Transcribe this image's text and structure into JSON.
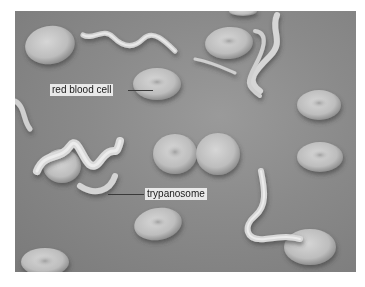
{
  "figure": {
    "type": "scanning electron micrograph",
    "labels": [
      {
        "id": "rbc",
        "text": "red blood cell"
      },
      {
        "id": "tryp",
        "text": "trypanosome"
      }
    ],
    "colors": {
      "background": "#888888",
      "cell_light": "#d8d8d8",
      "cell_mid": "#b5b5b5",
      "label_bg": "#e9e9e9"
    }
  }
}
